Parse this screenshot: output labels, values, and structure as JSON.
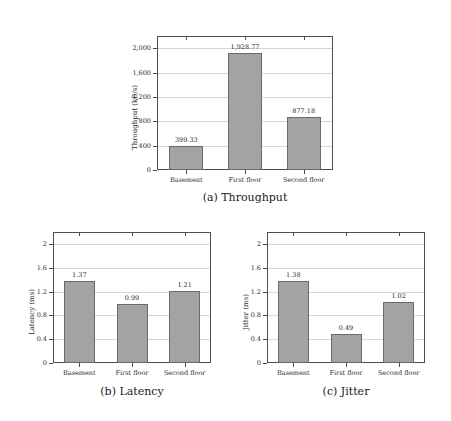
{
  "figure": {
    "panels": [
      {
        "id": "a",
        "caption": "(a) Throughput",
        "ylabel": "Throughput (kB/s)",
        "yticks": [
          "0",
          "400",
          "800",
          "1,200",
          "1,600",
          "2,000"
        ],
        "categories": [
          "Basement",
          "First floor",
          "Second floor"
        ],
        "values": [
          399.33,
          1928.77,
          877.18
        ],
        "value_labels": [
          "399.33",
          "1,928.77",
          "877.18"
        ],
        "ymin": 0,
        "ymax": 2200
      },
      {
        "id": "b",
        "caption": "(b) Latency",
        "ylabel": "Latency (ms)",
        "yticks": [
          "0",
          "0.4",
          "0.8",
          "1.2",
          "1.6",
          "2"
        ],
        "categories": [
          "Basement",
          "First floor",
          "Second floor"
        ],
        "values": [
          1.37,
          0.99,
          1.21
        ],
        "value_labels": [
          "1.37",
          "0.99",
          "1.21"
        ],
        "ymin": 0,
        "ymax": 2.2
      },
      {
        "id": "c",
        "caption": "(c) Jitter",
        "ylabel": "Jitter (ms)",
        "yticks": [
          "0",
          "0.4",
          "0.8",
          "1.2",
          "1.6",
          "2"
        ],
        "categories": [
          "Basement",
          "First floor",
          "Second floor"
        ],
        "values": [
          1.38,
          0.49,
          1.02
        ],
        "value_labels": [
          "1.38",
          "0.49",
          "1.02"
        ],
        "ymin": 0,
        "ymax": 2.2
      }
    ]
  },
  "chart_data": [
    {
      "type": "bar",
      "title": "(a) Throughput",
      "xlabel": "",
      "ylabel": "Throughput (kB/s)",
      "categories": [
        "Basement",
        "First floor",
        "Second floor"
      ],
      "values": [
        399.33,
        1928.77,
        877.18
      ],
      "ylim": [
        0,
        2200
      ],
      "yticks": [
        0,
        400,
        800,
        1200,
        1600,
        2000
      ],
      "ytick_labels": [
        "0",
        "400",
        "800",
        "1,200",
        "1,600",
        "2,000"
      ],
      "data_labels": [
        "399.33",
        "1,928.77",
        "877.18"
      ],
      "grid": "horizontal",
      "legend": "none",
      "bar_color": "#a3a3a3",
      "bar_edge_color": "#6a6a6a"
    },
    {
      "type": "bar",
      "title": "(b) Latency",
      "xlabel": "",
      "ylabel": "Latency (ms)",
      "categories": [
        "Basement",
        "First floor",
        "Second floor"
      ],
      "values": [
        1.37,
        0.99,
        1.21
      ],
      "ylim": [
        0,
        2.2
      ],
      "yticks": [
        0,
        0.4,
        0.8,
        1.2,
        1.6,
        2
      ],
      "ytick_labels": [
        "0",
        "0.4",
        "0.8",
        "1.2",
        "1.6",
        "2"
      ],
      "data_labels": [
        "1.37",
        "0.99",
        "1.21"
      ],
      "grid": "horizontal",
      "legend": "none",
      "bar_color": "#a3a3a3",
      "bar_edge_color": "#6a6a6a"
    },
    {
      "type": "bar",
      "title": "(c) Jitter",
      "xlabel": "",
      "ylabel": "Jitter (ms)",
      "categories": [
        "Basement",
        "First floor",
        "Second floor"
      ],
      "values": [
        1.38,
        0.49,
        1.02
      ],
      "ylim": [
        0,
        2.2
      ],
      "yticks": [
        0,
        0.4,
        0.8,
        1.2,
        1.6,
        2
      ],
      "ytick_labels": [
        "0",
        "0.4",
        "0.8",
        "1.2",
        "1.6",
        "2"
      ],
      "data_labels": [
        "1.38",
        "0.49",
        "1.02"
      ],
      "grid": "horizontal",
      "legend": "none",
      "bar_color": "#a3a3a3",
      "bar_edge_color": "#6a6a6a"
    }
  ]
}
